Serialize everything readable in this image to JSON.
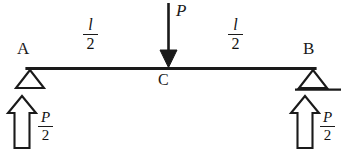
{
  "diagram": {
    "background": "#ffffff",
    "ink": "#1a1a1a",
    "points": {
      "left_support": "A",
      "right_support": "B",
      "midspan": "C"
    },
    "load": {
      "label": "P",
      "direction": "down",
      "location": "midspan",
      "arrow_style": "solid-filled-head"
    },
    "dimensions": [
      {
        "name": "left-half-span",
        "numerator": "l",
        "denominator": "2"
      },
      {
        "name": "right-half-span",
        "numerator": "l",
        "denominator": "2"
      }
    ],
    "reactions": [
      {
        "name": "left-reaction",
        "numerator": "P",
        "denominator": "2",
        "direction": "up",
        "arrow_style": "hollow-block"
      },
      {
        "name": "right-reaction",
        "numerator": "P",
        "denominator": "2",
        "direction": "up",
        "arrow_style": "hollow-block"
      }
    ],
    "supports": [
      {
        "name": "pin-support-A",
        "shape": "hollow-triangle",
        "ground_line": false
      },
      {
        "name": "roller-support-B",
        "shape": "hollow-triangle",
        "ground_line": true
      }
    ]
  }
}
